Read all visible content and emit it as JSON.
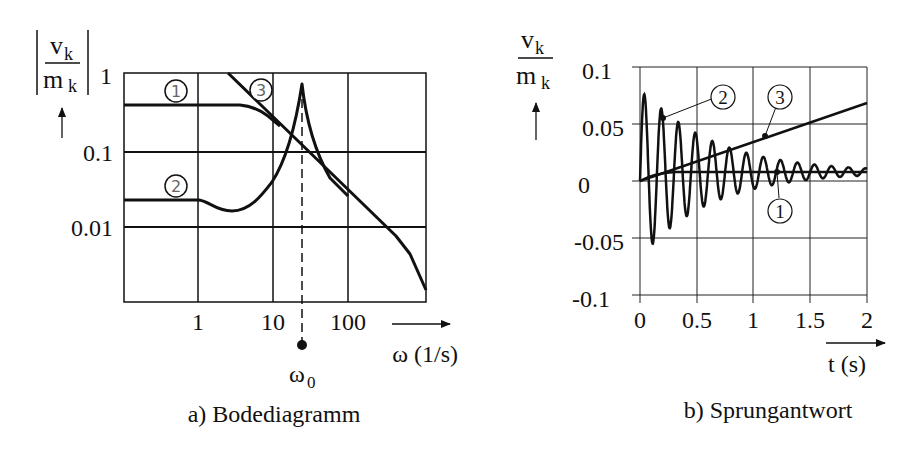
{
  "chart_data": [
    {
      "type": "line",
      "title": "a) Bodediagramm",
      "xscale": "log",
      "yscale": "log",
      "xlabel": "ω (1/s)",
      "ylabel": "|v_k / m_k|",
      "xticks": [
        "1",
        "10",
        "100"
      ],
      "yticks": [
        "1",
        "0.1",
        "0.01"
      ],
      "xlim": [
        0.1,
        1000
      ],
      "ylim": [
        0.001,
        1
      ],
      "grid": true,
      "annotations": [
        {
          "text": "ω0",
          "x": 24,
          "style": "dashed vertical line with dot"
        }
      ],
      "series": [
        {
          "name": "1",
          "x": [
            0.1,
            1,
            2,
            3,
            5,
            10,
            24,
            100
          ],
          "y": [
            0.4,
            0.4,
            0.4,
            0.38,
            0.3,
            0.17,
            0.075,
            0.018
          ]
        },
        {
          "name": "2",
          "x": [
            0.1,
            1,
            2,
            3,
            5,
            8,
            10,
            15,
            20,
            24,
            28,
            40,
            60,
            100,
            200,
            500,
            1000
          ],
          "y": [
            0.022,
            0.022,
            0.018,
            0.017,
            0.019,
            0.028,
            0.04,
            0.12,
            0.35,
            0.75,
            0.35,
            0.09,
            0.045,
            0.019,
            0.0085,
            0.0032,
            0.0012
          ]
        },
        {
          "name": "3",
          "x": [
            2.4,
            10,
            24,
            100,
            200,
            500,
            1000
          ],
          "y": [
            1,
            0.24,
            0.1,
            0.024,
            0.012,
            0.005,
            0.0012
          ]
        }
      ]
    },
    {
      "type": "line",
      "title": "b) Sprungantwort",
      "xlabel": "t (s)",
      "ylabel": "v_k / m_k",
      "xticks": [
        "0",
        "0.5",
        "1",
        "1.5",
        "2"
      ],
      "yticks": [
        "0.1",
        "0.05",
        "0",
        "-0.05",
        "-0.1"
      ],
      "xlim": [
        0,
        2
      ],
      "ylim": [
        -0.1,
        0.1
      ],
      "grid": true,
      "series": [
        {
          "name": "1",
          "description": "step response, quickly rises to constant",
          "x": [
            0,
            0.1,
            0.5,
            1,
            1.5,
            2
          ],
          "y": [
            0,
            0.008,
            0.008,
            0.008,
            0.008,
            0.008
          ]
        },
        {
          "name": "2",
          "description": "damped oscillation about 0.008, period ≈ 0.15 s",
          "x": [
            0.04,
            0.12,
            0.19,
            0.34,
            0.5,
            1.0,
            1.5,
            2.0
          ],
          "y": [
            0.079,
            -0.061,
            0.064,
            0.052,
            0.043,
            0.018,
            0.014,
            0.01
          ],
          "period": 0.15,
          "offset": 0.008,
          "amplitude0": 0.075,
          "decay": 1.6
        },
        {
          "name": "3",
          "description": "linear ramp",
          "x": [
            0,
            2
          ],
          "y": [
            0,
            0.068
          ]
        }
      ]
    }
  ],
  "left": {
    "ylabel_num": "v",
    "ylabel_num_sub": "k",
    "ylabel_den": "m",
    "ylabel_den_sub": "k",
    "yticks": [
      "1",
      "0.1",
      "0.01"
    ],
    "xticks": [
      "1",
      "10",
      "100"
    ],
    "xaxis_label": "ω (1/s)",
    "omega0": "ω",
    "omega0_sub": "0",
    "caption": "a) Bodediagramm",
    "curve_labels": [
      "1",
      "2",
      "3"
    ]
  },
  "right": {
    "ylabel_num": "v",
    "ylabel_num_sub": "k",
    "ylabel_den": "m",
    "ylabel_den_sub": "k",
    "yticks": [
      "0.1",
      "0.05",
      "0",
      "-0.05",
      "-0.1"
    ],
    "xticks": [
      "0",
      "0.5",
      "1",
      "1.5",
      "2"
    ],
    "xaxis_label": "t (s)",
    "caption": "b) Sprungantwort",
    "curve_labels": [
      "2",
      "3",
      "1"
    ]
  }
}
